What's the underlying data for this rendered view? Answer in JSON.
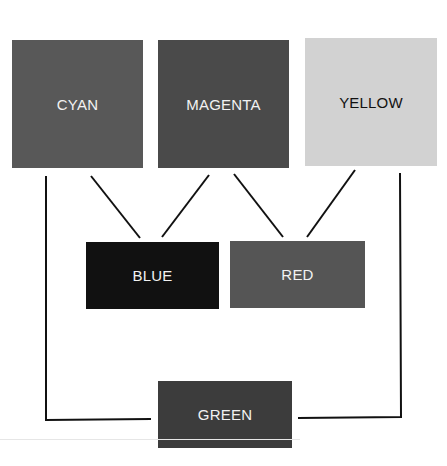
{
  "diagram": {
    "type": "subtractive-color-mixing",
    "primaries": [
      {
        "label": "CYAN",
        "color": "#585858",
        "text_color": "#f2f2f2"
      },
      {
        "label": "MAGENTA",
        "color": "#4a4a4a",
        "text_color": "#f2f2f2"
      },
      {
        "label": "YELLOW",
        "color": "#d2d2d2",
        "text_color": "#111111"
      }
    ],
    "secondaries": [
      {
        "label": "BLUE",
        "color": "#111111",
        "text_color": "#f2f2f2",
        "mix_of": [
          "CYAN",
          "MAGENTA"
        ]
      },
      {
        "label": "RED",
        "color": "#555555",
        "text_color": "#f2f2f2",
        "mix_of": [
          "MAGENTA",
          "YELLOW"
        ]
      }
    ],
    "bottom": {
      "label": "GREEN",
      "color": "#3c3c3c",
      "text_color": "#f2f2f2",
      "mix_of": [
        "CYAN",
        "YELLOW"
      ]
    },
    "connector_color": "#111111"
  }
}
